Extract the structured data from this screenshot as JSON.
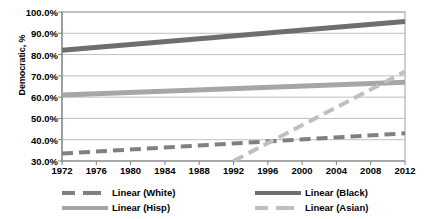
{
  "chart_data": {
    "type": "line",
    "title": "",
    "xlabel": "",
    "ylabel": "Democratic, %",
    "xlim": [
      1972,
      2012
    ],
    "ylim": [
      30,
      100
    ],
    "grid": true,
    "legend_position": "bottom",
    "ytick_labels": [
      "100.0%",
      "90.0%",
      "80.0%",
      "70.0%",
      "60.0%",
      "50.0%",
      "40.0%",
      "30.0%"
    ],
    "ytick_values": [
      100,
      90,
      80,
      70,
      60,
      50,
      40,
      30
    ],
    "xtick_labels": [
      "1972",
      "1976",
      "1980",
      "1984",
      "1988",
      "1992",
      "1996",
      "2000",
      "2004",
      "2008",
      "2012"
    ],
    "xtick_values": [
      1972,
      1976,
      1980,
      1984,
      1988,
      1992,
      1996,
      2000,
      2004,
      2008,
      2012
    ],
    "series": [
      {
        "name": "Linear (White)",
        "color": "#808080",
        "style": "dashed",
        "width": 4,
        "x": [
          1972,
          2012
        ],
        "values": [
          33.5,
          43.0
        ]
      },
      {
        "name": "Linear (Black)",
        "color": "#6e6e6e",
        "style": "solid",
        "width": 5,
        "x": [
          1972,
          2012
        ],
        "values": [
          82.0,
          95.5
        ]
      },
      {
        "name": "Linear (Hisp)",
        "color": "#a6a6a6",
        "style": "solid",
        "width": 5,
        "x": [
          1972,
          2012
        ],
        "values": [
          61.0,
          67.0
        ]
      },
      {
        "name": "Linear (Asian)",
        "color": "#bfbfbf",
        "style": "dashed",
        "width": 4,
        "x": [
          1992,
          2012
        ],
        "values": [
          30.0,
          72.0
        ]
      }
    ]
  },
  "legend": {
    "items": [
      {
        "label": "Linear (White)",
        "color": "#808080",
        "style": "dashed"
      },
      {
        "label": "Linear (Black)",
        "color": "#6e6e6e",
        "style": "solid"
      },
      {
        "label": "Linear (Hisp)",
        "color": "#a6a6a6",
        "style": "solid"
      },
      {
        "label": "Linear (Asian)",
        "color": "#bfbfbf",
        "style": "dashed"
      }
    ]
  },
  "colors": {
    "plot_border": "#a0a0a0",
    "gridline": "#bfbfbf",
    "axis": "#808080",
    "text": "#000000",
    "background": "#ffffff"
  }
}
